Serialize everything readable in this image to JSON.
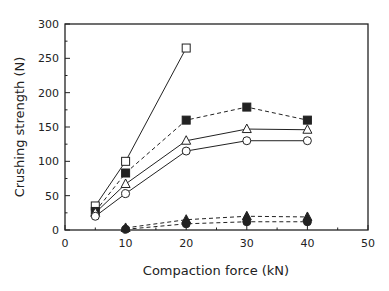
{
  "chart_data": {
    "type": "line",
    "title": "",
    "xlabel": "Compaction force (kN)",
    "ylabel": "Crushing strength (N)",
    "xlim": [
      0,
      50
    ],
    "ylim": [
      0,
      300
    ],
    "xticks": [
      0,
      10,
      20,
      30,
      40,
      50
    ],
    "yticks": [
      0,
      50,
      100,
      150,
      200,
      250,
      300
    ],
    "grid": false,
    "legend": null,
    "series": [
      {
        "name": "open-square",
        "marker": "square-open",
        "line": "solid",
        "x": [
          5,
          10,
          20
        ],
        "values": [
          35,
          100,
          265
        ]
      },
      {
        "name": "filled-square",
        "marker": "square-filled",
        "line": "dashed",
        "x": [
          5,
          10,
          20,
          30,
          40
        ],
        "values": [
          27,
          83,
          160,
          179,
          160
        ]
      },
      {
        "name": "open-triangle",
        "marker": "triangle-open",
        "line": "solid",
        "x": [
          5,
          10,
          20,
          30,
          40
        ],
        "values": [
          25,
          67,
          130,
          147,
          146
        ]
      },
      {
        "name": "open-circle",
        "marker": "circle-open",
        "line": "solid",
        "x": [
          5,
          10,
          20,
          30,
          40
        ],
        "values": [
          20,
          53,
          115,
          130,
          130
        ]
      },
      {
        "name": "filled-triangle",
        "marker": "triangle-filled",
        "line": "dashed",
        "x": [
          10,
          20,
          30,
          40
        ],
        "values": [
          3,
          15,
          20,
          19
        ]
      },
      {
        "name": "filled-circle",
        "marker": "circle-filled",
        "line": "dashed",
        "x": [
          10,
          20,
          30,
          40
        ],
        "values": [
          1,
          9,
          12,
          12
        ]
      }
    ]
  }
}
